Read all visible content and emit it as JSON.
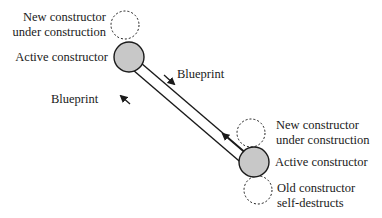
{
  "diagram": {
    "labels": {
      "top_new": [
        "New constructor",
        "under construction"
      ],
      "top_active": "Active constructor",
      "blueprint_down": "Blueprint",
      "blueprint_up": "Blueprint",
      "bottom_new": [
        "New constructor",
        "under construction"
      ],
      "bottom_active": "Active constructor",
      "bottom_old": [
        "Old constructor",
        "self-destructs"
      ]
    },
    "colors": {
      "active_fill": "#c8c8c8",
      "stroke": "#1a1a1a",
      "background": "#ffffff"
    }
  }
}
